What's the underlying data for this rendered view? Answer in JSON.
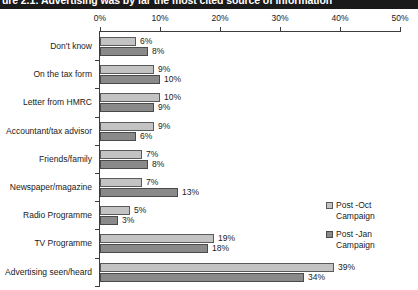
{
  "title": "ure 2.1: Advertising was by far the most cited source of information",
  "chart_data": {
    "type": "bar",
    "orientation": "horizontal",
    "title": "ure 2.1: Advertising was by far the most cited source of information",
    "xlabel": "",
    "ylabel": "",
    "xlim": [
      0,
      50
    ],
    "xticks": [
      "0%",
      "10%",
      "20%",
      "30%",
      "40%",
      "50%"
    ],
    "xtick_values": [
      0,
      10,
      20,
      30,
      40,
      50
    ],
    "grid": false,
    "legend_position": "right",
    "value_suffix": "%",
    "categories": [
      "Don't know",
      "On the tax form",
      "Letter from HMRC",
      "Accountant/tax advisor",
      "Friends/family",
      "Newspaper/magazine",
      "Radio Programme",
      "TV Programme",
      "Advertising seen/heard"
    ],
    "series": [
      {
        "name": "Post -Oct\nCampaign",
        "color": "#c3c3c3",
        "values": [
          6,
          9,
          10,
          9,
          7,
          7,
          5,
          19,
          39
        ],
        "labels": [
          "6%",
          "9%",
          "10%",
          "9%",
          "7%",
          "7%",
          "5%",
          "19%",
          "39%"
        ]
      },
      {
        "name": "Post -Jan\nCampaign",
        "color": "#8a8a8a",
        "values": [
          8,
          10,
          9,
          6,
          8,
          13,
          3,
          18,
          34
        ],
        "labels": [
          "8%",
          "10%",
          "9%",
          "6%",
          "8%",
          "13%",
          "3%",
          "18%",
          "34%"
        ]
      }
    ]
  }
}
